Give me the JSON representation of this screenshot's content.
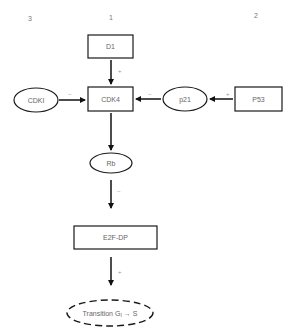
{
  "columns": [
    {
      "id": "col3",
      "label": "3",
      "x": 30,
      "y": 21
    },
    {
      "id": "col1",
      "label": "1",
      "x": 111,
      "y": 20
    },
    {
      "id": "col2",
      "label": "2",
      "x": 256,
      "y": 18
    }
  ],
  "nodes": {
    "d1": {
      "label": "D1",
      "shape": "box"
    },
    "cdk4": {
      "label": "CDK4",
      "shape": "box"
    },
    "cdki": {
      "label": "CDKI",
      "shape": "ellipse"
    },
    "p21": {
      "label": "p21",
      "shape": "ellipse"
    },
    "p53": {
      "label": "P53",
      "shape": "box"
    },
    "rb": {
      "label": "Rb",
      "shape": "ellipse"
    },
    "e2f": {
      "label": "E2F-DP",
      "shape": "box"
    },
    "transition": {
      "label_prefix": "Transition  G",
      "subscript": "I",
      "arrow": "→",
      "label_suffix": "S",
      "shape": "dashed-ellipse"
    }
  },
  "edges": [
    {
      "from": "D1",
      "to": "CDK4",
      "sign": "+"
    },
    {
      "from": "CDKI",
      "to": "CDK4",
      "sign": "–"
    },
    {
      "from": "p21",
      "to": "CDK4",
      "sign": "–"
    },
    {
      "from": "P53",
      "to": "p21",
      "sign": "+"
    },
    {
      "from": "CDK4",
      "to": "Rb",
      "sign": ""
    },
    {
      "from": "Rb",
      "to": "E2F-DP",
      "sign": "–"
    },
    {
      "from": "E2F-DP",
      "to": "Transition G1→S",
      "sign": "+"
    }
  ],
  "signs": {
    "d1_cdk4": "+",
    "cdki_cdk4": "–",
    "p21_cdk4": "–",
    "p53_p21": "+",
    "rb_e2f": "–",
    "e2f_trans": "+"
  },
  "colors": {
    "stroke": "#1a1a1a",
    "text": "#666666",
    "background": "#ffffff"
  }
}
